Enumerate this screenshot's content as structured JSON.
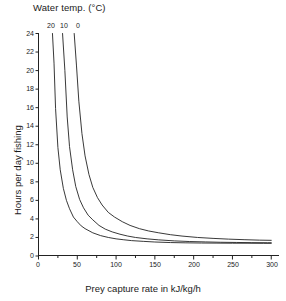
{
  "chart_data": {
    "type": "line",
    "title": "Water temp. (°C)",
    "xlabel": "Prey capture rate in kJ/kg/h",
    "ylabel": "Hours per day fishing",
    "xlim": [
      0,
      310
    ],
    "ylim": [
      0,
      24
    ],
    "xticks": [
      0,
      50,
      100,
      150,
      200,
      250,
      300
    ],
    "xtick_labels": [
      "0",
      "50",
      "100",
      "150",
      "200",
      "250",
      "300"
    ],
    "xminor_ticks": [
      25,
      75,
      125,
      175,
      225,
      275
    ],
    "yticks": [
      0,
      2,
      4,
      6,
      8,
      10,
      12,
      14,
      16,
      18,
      20,
      22,
      24
    ],
    "ytick_labels": [
      "0",
      "2",
      "4",
      "6",
      "8",
      "10",
      "12",
      "14",
      "16",
      "18",
      "20",
      "22",
      "24"
    ],
    "grid": false,
    "legend_position": "top-inside",
    "line_color": "#222222",
    "series": [
      {
        "name": "20",
        "label": "20",
        "asymptote_x": 13.5,
        "scale": 135,
        "x": [
          18,
          20,
          22,
          25,
          28,
          32,
          36,
          40,
          45,
          50,
          55,
          60,
          70,
          80,
          90,
          100,
          110,
          120,
          135,
          150,
          170,
          190,
          210,
          230,
          250,
          270,
          290,
          300
        ],
        "y": [
          24.0,
          20.8,
          15.9,
          11.7,
          9.3,
          7.3,
          6.0,
          5.1,
          4.2,
          3.7,
          3.25,
          2.95,
          2.5,
          2.2,
          2.0,
          1.85,
          1.75,
          1.66,
          1.58,
          1.51,
          1.45,
          1.42,
          1.4,
          1.39,
          1.38,
          1.38,
          1.37,
          1.37
        ]
      },
      {
        "name": "10",
        "label": "10",
        "asymptote_x": 26.5,
        "scale": 165,
        "x": [
          31,
          34,
          37,
          40,
          44,
          48,
          53,
          58,
          64,
          70,
          78,
          86,
          95,
          105,
          115,
          125,
          140,
          155,
          175,
          195,
          215,
          235,
          255,
          275,
          295,
          300
        ],
        "y": [
          24.0,
          20.0,
          15.0,
          11.8,
          9.3,
          7.5,
          6.1,
          5.2,
          4.4,
          3.9,
          3.3,
          2.9,
          2.6,
          2.35,
          2.15,
          2.0,
          1.85,
          1.74,
          1.63,
          1.56,
          1.52,
          1.48,
          1.46,
          1.44,
          1.43,
          1.43
        ]
      },
      {
        "name": "0",
        "label": "0",
        "asymptote_x": 40.5,
        "scale": 200,
        "x": [
          46,
          49,
          52,
          56,
          60,
          65,
          70,
          76,
          82,
          90,
          98,
          108,
          118,
          130,
          142,
          155,
          170,
          185,
          205,
          225,
          245,
          265,
          285,
          300
        ],
        "y": [
          24.0,
          20.5,
          16.7,
          13.2,
          10.8,
          8.8,
          7.4,
          6.3,
          5.5,
          4.7,
          4.2,
          3.7,
          3.3,
          2.95,
          2.7,
          2.5,
          2.3,
          2.15,
          2.0,
          1.9,
          1.82,
          1.76,
          1.71,
          1.69
        ]
      }
    ]
  },
  "axes": {
    "y_axis_name": "hours-per-day-fishing-axis",
    "x_axis_name": "prey-capture-rate-axis"
  }
}
